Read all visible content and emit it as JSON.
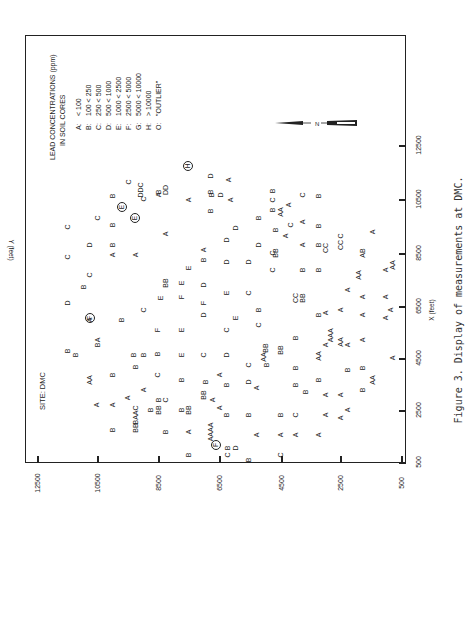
{
  "chart_data": {
    "type": "scatter",
    "title": "SITE: DMC",
    "xlabel": "X (feet)",
    "ylabel": "Y (feet)",
    "xlim": [
      500,
      12500
    ],
    "ylim": [
      500,
      12500
    ],
    "xticks": [
      "500",
      "2500",
      "4500",
      "6500",
      "8500",
      "10500",
      "12500"
    ],
    "yticks": [
      "12500",
      "10500",
      "8500",
      "6500",
      "4500",
      "2500",
      "500"
    ],
    "grid": false,
    "legend": {
      "title_line1": "LEAD CONCENTRATIONS (ppm)",
      "title_line2": "IN SOIL CORES",
      "entries": [
        {
          "key": "A:",
          "range": "< 100"
        },
        {
          "key": "B:",
          "range": "100 < 250"
        },
        {
          "key": "C:",
          "range": "250 < 500"
        },
        {
          "key": "D:",
          "range": "500 < 1000"
        },
        {
          "key": "E:",
          "range": "1000 < 2500"
        },
        {
          "key": "F:",
          "range": "2500 < 5000"
        },
        {
          "key": "G:",
          "range": "5000 < 10000"
        },
        {
          "key": "H:",
          "range": "> 10000"
        },
        {
          "key": "O:",
          "range": "\"OUTLIER\""
        }
      ]
    },
    "north_label": "N",
    "caption": "Figure 3.  Display of measurements at DMC.",
    "points_note": "Letter codes placed at approximate (X,Y) feet positions; circled = outlier-flagged",
    "points": [
      {
        "px": 67,
        "py": 351,
        "l": "B"
      },
      {
        "px": 67,
        "py": 303,
        "l": "D"
      },
      {
        "px": 67,
        "py": 257,
        "l": "C"
      },
      {
        "px": 67,
        "py": 227,
        "l": "C"
      },
      {
        "px": 75,
        "py": 355,
        "l": "B"
      },
      {
        "px": 83,
        "py": 287,
        "l": "B"
      },
      {
        "px": 89,
        "py": 380,
        "l": "AA"
      },
      {
        "px": 89,
        "py": 320,
        "l": "A"
      },
      {
        "px": 90,
        "py": 318,
        "l": "F",
        "c": true
      },
      {
        "px": 89,
        "py": 275,
        "l": "C"
      },
      {
        "px": 89,
        "py": 245,
        "l": "D"
      },
      {
        "px": 96,
        "py": 405,
        "l": "A"
      },
      {
        "px": 97,
        "py": 345,
        "l": "B"
      },
      {
        "px": 97,
        "py": 340,
        "l": "A"
      },
      {
        "px": 97,
        "py": 218,
        "l": "C"
      },
      {
        "px": 112,
        "py": 430,
        "l": "B"
      },
      {
        "px": 112,
        "py": 405,
        "l": "A"
      },
      {
        "px": 112,
        "py": 375,
        "l": "B"
      },
      {
        "px": 112,
        "py": 255,
        "l": "A"
      },
      {
        "px": 112,
        "py": 245,
        "l": "B"
      },
      {
        "px": 112,
        "py": 225,
        "l": "B"
      },
      {
        "px": 112,
        "py": 196,
        "l": "B"
      },
      {
        "px": 121,
        "py": 320,
        "l": "B"
      },
      {
        "px": 122,
        "py": 207,
        "l": "E",
        "c": true
      },
      {
        "px": 128,
        "py": 182,
        "l": "C"
      },
      {
        "px": 127,
        "py": 398,
        "l": "A"
      },
      {
        "px": 135,
        "py": 428,
        "l": "BB"
      },
      {
        "px": 135,
        "py": 415,
        "l": "BAAC"
      },
      {
        "px": 133,
        "py": 355,
        "l": "B"
      },
      {
        "px": 135,
        "py": 367,
        "l": "B"
      },
      {
        "px": 135,
        "py": 255,
        "l": "A"
      },
      {
        "px": 135,
        "py": 218,
        "l": "E",
        "c": true
      },
      {
        "px": 140,
        "py": 190,
        "l": "DDC"
      },
      {
        "px": 143,
        "py": 390,
        "l": "A"
      },
      {
        "px": 143,
        "py": 355,
        "l": "B"
      },
      {
        "px": 143,
        "py": 310,
        "l": "C"
      },
      {
        "px": 143,
        "py": 199,
        "l": "C"
      },
      {
        "px": 150,
        "py": 410,
        "l": "B"
      },
      {
        "px": 158,
        "py": 410,
        "l": "BB"
      },
      {
        "px": 158,
        "py": 400,
        "l": "B"
      },
      {
        "px": 165,
        "py": 432,
        "l": "B"
      },
      {
        "px": 165,
        "py": 400,
        "l": "C"
      },
      {
        "px": 157,
        "py": 375,
        "l": "C"
      },
      {
        "px": 157,
        "py": 354,
        "l": "B"
      },
      {
        "px": 157,
        "py": 330,
        "l": "F"
      },
      {
        "px": 160,
        "py": 298,
        "l": "E"
      },
      {
        "px": 165,
        "py": 283,
        "l": "BB"
      },
      {
        "px": 158,
        "py": 195,
        "l": "A"
      },
      {
        "px": 158,
        "py": 192,
        "l": "B"
      },
      {
        "px": 165,
        "py": 190,
        "l": "DD"
      },
      {
        "px": 165,
        "py": 234,
        "l": "A"
      },
      {
        "px": 181,
        "py": 410,
        "l": "B"
      },
      {
        "px": 181,
        "py": 380,
        "l": "B"
      },
      {
        "px": 181,
        "py": 355,
        "l": "E"
      },
      {
        "px": 181,
        "py": 330,
        "l": "E"
      },
      {
        "px": 181,
        "py": 297,
        "l": "F"
      },
      {
        "px": 181,
        "py": 283,
        "l": "E"
      },
      {
        "px": 188,
        "py": 268,
        "l": "E"
      },
      {
        "px": 188,
        "py": 200,
        "l": "A"
      },
      {
        "px": 188,
        "py": 455,
        "l": "B"
      },
      {
        "px": 188,
        "py": 432,
        "l": "A"
      },
      {
        "px": 188,
        "py": 410,
        "l": "BB"
      },
      {
        "px": 203,
        "py": 395,
        "l": "BB"
      },
      {
        "px": 205,
        "py": 382,
        "l": "B"
      },
      {
        "px": 203,
        "py": 355,
        "l": "C"
      },
      {
        "px": 203,
        "py": 315,
        "l": "D"
      },
      {
        "px": 203,
        "py": 303,
        "l": "F"
      },
      {
        "px": 203,
        "py": 285,
        "l": "D"
      },
      {
        "px": 203,
        "py": 260,
        "l": "B"
      },
      {
        "px": 203,
        "py": 250,
        "l": "A"
      },
      {
        "px": 210,
        "py": 432,
        "l": "AAAA"
      },
      {
        "px": 212,
        "py": 400,
        "l": "A"
      },
      {
        "px": 210,
        "py": 211,
        "l": "B"
      },
      {
        "px": 210,
        "py": 192,
        "l": "B"
      },
      {
        "px": 216,
        "py": 445,
        "l": "F",
        "c": true
      },
      {
        "px": 219,
        "py": 408,
        "l": "A"
      },
      {
        "px": 219,
        "py": 375,
        "l": "A"
      },
      {
        "px": 220,
        "py": 195,
        "l": "D"
      },
      {
        "px": 230,
        "py": 200,
        "l": "A"
      },
      {
        "px": 227,
        "py": 448,
        "l": "B"
      },
      {
        "px": 226,
        "py": 415,
        "l": "B"
      },
      {
        "px": 226,
        "py": 385,
        "l": "B"
      },
      {
        "px": 226,
        "py": 355,
        "l": "D"
      },
      {
        "px": 226,
        "py": 330,
        "l": "C"
      },
      {
        "px": 226,
        "py": 293,
        "l": "E"
      },
      {
        "px": 226,
        "py": 262,
        "l": "D"
      },
      {
        "px": 226,
        "py": 240,
        "l": "D"
      },
      {
        "px": 227,
        "py": 455,
        "l": "C"
      },
      {
        "px": 235,
        "py": 448,
        "l": "D"
      },
      {
        "px": 235,
        "py": 318,
        "l": "E"
      },
      {
        "px": 235,
        "py": 228,
        "l": "D"
      },
      {
        "px": 248,
        "py": 460,
        "l": "B"
      },
      {
        "px": 248,
        "py": 415,
        "l": "B"
      },
      {
        "px": 248,
        "py": 382,
        "l": "D"
      },
      {
        "px": 248,
        "py": 365,
        "l": "C"
      },
      {
        "px": 248,
        "py": 293,
        "l": "C"
      },
      {
        "px": 248,
        "py": 262,
        "l": "D"
      },
      {
        "px": 256,
        "py": 435,
        "l": "A"
      },
      {
        "px": 256,
        "py": 388,
        "l": "A"
      },
      {
        "px": 258,
        "py": 310,
        "l": "B"
      },
      {
        "px": 258,
        "py": 325,
        "l": "C"
      },
      {
        "px": 258,
        "py": 245,
        "l": "D"
      },
      {
        "px": 258,
        "py": 218,
        "l": "B"
      },
      {
        "px": 263,
        "py": 357,
        "l": "AA"
      },
      {
        "px": 266,
        "py": 365,
        "l": "B"
      },
      {
        "px": 265,
        "py": 348,
        "l": "BB"
      },
      {
        "px": 272,
        "py": 270,
        "l": "C"
      },
      {
        "px": 272,
        "py": 253,
        "l": "C"
      },
      {
        "px": 275,
        "py": 253,
        "l": "BB"
      },
      {
        "px": 275,
        "py": 230,
        "l": "B"
      },
      {
        "px": 272,
        "py": 210,
        "l": "B"
      },
      {
        "px": 272,
        "py": 200,
        "l": "C"
      },
      {
        "px": 272,
        "py": 191,
        "l": "B"
      },
      {
        "px": 285,
        "py": 236,
        "l": "A"
      },
      {
        "px": 280,
        "py": 455,
        "l": "C"
      },
      {
        "px": 280,
        "py": 435,
        "l": "A"
      },
      {
        "px": 280,
        "py": 415,
        "l": "B"
      },
      {
        "px": 280,
        "py": 350,
        "l": "BB"
      },
      {
        "px": 280,
        "py": 212,
        "l": "AA"
      },
      {
        "px": 288,
        "py": 205,
        "l": "A"
      },
      {
        "px": 290,
        "py": 225,
        "l": "C"
      },
      {
        "px": 295,
        "py": 435,
        "l": "A"
      },
      {
        "px": 295,
        "py": 415,
        "l": "C"
      },
      {
        "px": 295,
        "py": 385,
        "l": "B"
      },
      {
        "px": 295,
        "py": 368,
        "l": "B"
      },
      {
        "px": 295,
        "py": 338,
        "l": "B"
      },
      {
        "px": 295,
        "py": 298,
        "l": "CC"
      },
      {
        "px": 302,
        "py": 298,
        "l": "BB"
      },
      {
        "px": 305,
        "py": 392,
        "l": "B"
      },
      {
        "px": 302,
        "py": 270,
        "l": "B"
      },
      {
        "px": 302,
        "py": 245,
        "l": "A"
      },
      {
        "px": 302,
        "py": 222,
        "l": "A"
      },
      {
        "px": 302,
        "py": 195,
        "l": "C"
      },
      {
        "px": 318,
        "py": 435,
        "l": "A"
      },
      {
        "px": 318,
        "py": 380,
        "l": "B"
      },
      {
        "px": 318,
        "py": 356,
        "l": "AA"
      },
      {
        "px": 318,
        "py": 315,
        "l": "B"
      },
      {
        "px": 318,
        "py": 270,
        "l": "B"
      },
      {
        "px": 318,
        "py": 245,
        "l": "B"
      },
      {
        "px": 318,
        "py": 226,
        "l": "B"
      },
      {
        "px": 318,
        "py": 196,
        "l": "B"
      },
      {
        "px": 325,
        "py": 415,
        "l": "A"
      },
      {
        "px": 325,
        "py": 395,
        "l": "A"
      },
      {
        "px": 325,
        "py": 345,
        "l": "A"
      },
      {
        "px": 325,
        "py": 313,
        "l": "A"
      },
      {
        "px": 325,
        "py": 248,
        "l": "CC"
      },
      {
        "px": 330,
        "py": 340,
        "l": "A"
      },
      {
        "px": 330,
        "py": 333,
        "l": "AA"
      },
      {
        "px": 340,
        "py": 418,
        "l": "A"
      },
      {
        "px": 340,
        "py": 395,
        "l": "A"
      },
      {
        "px": 340,
        "py": 342,
        "l": "AA"
      },
      {
        "px": 340,
        "py": 310,
        "l": "A"
      },
      {
        "px": 340,
        "py": 245,
        "l": "CC"
      },
      {
        "px": 340,
        "py": 236,
        "l": "C"
      },
      {
        "px": 347,
        "py": 410,
        "l": "A"
      },
      {
        "px": 347,
        "py": 370,
        "l": "B"
      },
      {
        "px": 347,
        "py": 345,
        "l": "A"
      },
      {
        "px": 347,
        "py": 290,
        "l": "A"
      },
      {
        "px": 362,
        "py": 390,
        "l": "B"
      },
      {
        "px": 362,
        "py": 368,
        "l": "B"
      },
      {
        "px": 362,
        "py": 340,
        "l": "A"
      },
      {
        "px": 362,
        "py": 315,
        "l": "A"
      },
      {
        "px": 362,
        "py": 297,
        "l": "A"
      },
      {
        "px": 358,
        "py": 275,
        "l": "AA"
      },
      {
        "px": 362,
        "py": 253,
        "l": "AB"
      },
      {
        "px": 372,
        "py": 380,
        "l": "AA"
      },
      {
        "px": 372,
        "py": 232,
        "l": "A"
      },
      {
        "px": 385,
        "py": 318,
        "l": "A"
      },
      {
        "px": 385,
        "py": 297,
        "l": "A"
      },
      {
        "px": 385,
        "py": 270,
        "l": "A"
      },
      {
        "px": 392,
        "py": 358,
        "l": "A"
      },
      {
        "px": 390,
        "py": 310,
        "l": "A"
      },
      {
        "px": 392,
        "py": 265,
        "l": "AA"
      },
      {
        "px": 188,
        "py": 166,
        "l": "H",
        "c": true
      },
      {
        "px": 210,
        "py": 176,
        "l": "D"
      },
      {
        "px": 228,
        "py": 180,
        "l": "A"
      },
      {
        "px": 211,
        "py": 195,
        "l": "B"
      }
    ]
  },
  "ticks": {
    "y_positions": [
      37,
      97,
      158,
      219,
      281,
      340,
      401
    ],
    "x_positions": [
      462,
      410,
      358,
      306,
      253,
      199,
      145
    ]
  }
}
